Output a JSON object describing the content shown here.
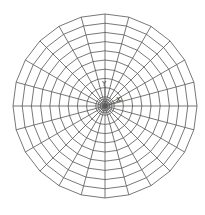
{
  "diagram": {
    "type": "polar-mesh",
    "center": {
      "x": 105,
      "y": 106
    },
    "outer_radius": 92,
    "spokes": 24,
    "rings": 10,
    "inner_dense_rings": 3,
    "line_color": "#555555",
    "background": "#ffffff",
    "axis_labels": {
      "y": "Y",
      "x": "X"
    }
  }
}
